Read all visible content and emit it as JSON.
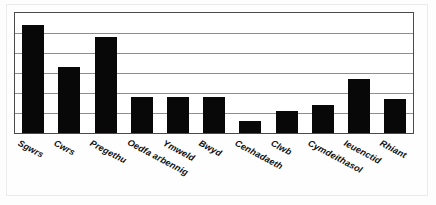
{
  "chart_data": {
    "type": "bar",
    "title": "",
    "subtitle": "",
    "xlabel": "",
    "ylabel": "",
    "categories": [
      "Sgwrs",
      "Cwrs",
      "Pregethu",
      "Oedfa arbennig",
      "Ymweld",
      "Bwyd",
      "Cenhadaeth",
      "Clwb",
      "Cymdeithasol",
      "Ieuenctid",
      "Rhiant"
    ],
    "values": [
      5.4,
      3.3,
      4.8,
      1.8,
      1.8,
      1.8,
      0.6,
      1.1,
      1.4,
      2.7,
      1.7
    ],
    "ylim": [
      0,
      6
    ],
    "yticks": [
      0,
      1,
      2,
      3,
      4,
      5,
      6
    ],
    "ytick_labels": [
      "",
      "",
      "",
      "",
      "",
      "",
      ""
    ],
    "grid": true,
    "gridline_count": 5,
    "legend": null,
    "legend_position": "none",
    "bar_color": "#080808",
    "gridline_color": "#8e8e8e",
    "frame_color": "#4a4a4a",
    "background_color": "#ffffff",
    "label_rotation_degrees": 28
  },
  "figure": {
    "name": "bar-chart",
    "plot_area": {
      "left": 14,
      "top": 12,
      "width": 400,
      "height": 122
    }
  }
}
